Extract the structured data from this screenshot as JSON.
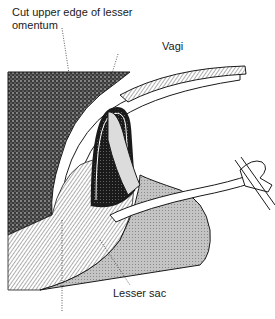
{
  "figure": {
    "type": "anatomical surgical illustration",
    "labels": {
      "cut_upper_edge": "Cut upper edge of lesser omentum",
      "vagi": "Vagi",
      "lesser_sac": "Lesser sac",
      "bottom_truncated": ""
    },
    "colors": {
      "line": "#1a1a1a",
      "stipple_dark": "#2a2a2a",
      "shade_gray": "#b8b8b8",
      "background": "#ffffff"
    }
  }
}
